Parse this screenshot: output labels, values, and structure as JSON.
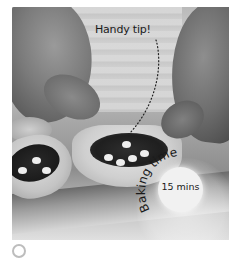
{
  "photo": {
    "description": "Grayscale photo of hands pressing filled filo pastry cases on a baking tray",
    "tones": {
      "background": "#c4c4c4",
      "filling": "#1f1f1f",
      "pastry": "#dcdcdc"
    }
  },
  "annotation": {
    "tip_label": "Handy tip!"
  },
  "badge": {
    "arc_label": "Baking time",
    "time_value": "15 mins",
    "circle_color": "#f1f1f1"
  },
  "footer": {
    "icon": "circle-icon"
  }
}
